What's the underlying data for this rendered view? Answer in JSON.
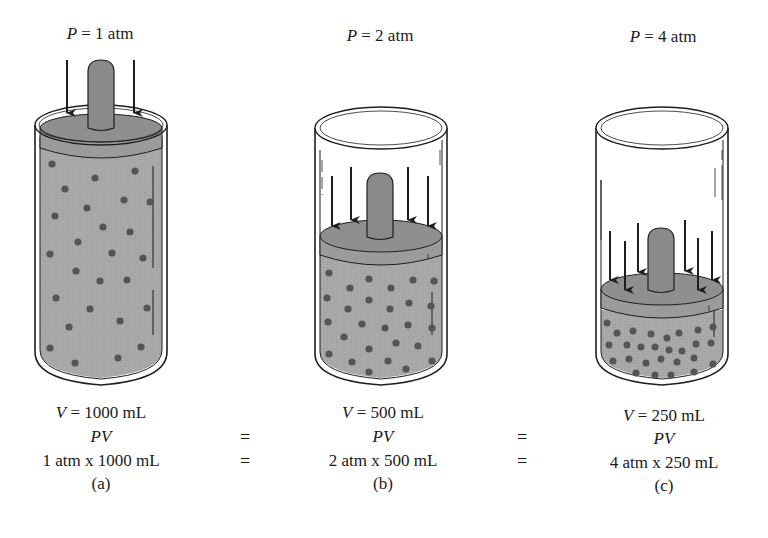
{
  "figure": {
    "colors": {
      "gas_fill": "#a9a9a9",
      "piston_top": "#8f8f8f",
      "piston_side": "#9b9b9b",
      "handle": "#8a8a8a",
      "molecule": "#555555",
      "outline": "#1e1e1e",
      "glass": "#ffffff"
    },
    "panels": [
      {
        "id": "a",
        "pressure_var": "P",
        "pressure_value": "= 1 atm",
        "volume_var": "V",
        "volume_value": "= 1000 mL",
        "pv_label": "PV",
        "product": "1 atm x 1000 mL",
        "caption": "(a)",
        "arrow_count": 2
      },
      {
        "id": "b",
        "pressure_var": "P",
        "pressure_value": "= 2 atm",
        "volume_var": "V",
        "volume_value": "= 500 mL",
        "pv_label": "PV",
        "product": "2 atm x 500 mL",
        "caption": "(b)",
        "arrow_count": 4
      },
      {
        "id": "c",
        "pressure_var": "P",
        "pressure_value": "= 4 atm",
        "volume_var": "V",
        "volume_value": "= 250 mL",
        "pv_label": "PV",
        "product": "4 atm x 250 mL",
        "caption": "(c)",
        "arrow_count": 6
      }
    ],
    "equals_sign": "=",
    "equals": [
      {
        "between": "a-b",
        "rows": [
          "=",
          "="
        ]
      },
      {
        "between": "b-c",
        "rows": [
          "=",
          "="
        ]
      }
    ]
  }
}
